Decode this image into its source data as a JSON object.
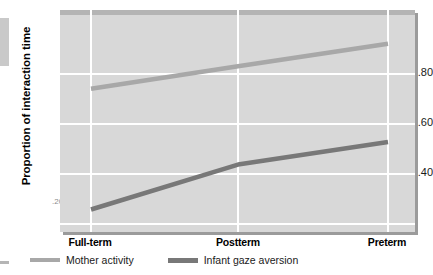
{
  "chart_data": {
    "type": "line",
    "title": "",
    "xlabel": "",
    "ylabel": "Proportion of interaction time",
    "categories": [
      "Full-term",
      "Postterm",
      "Preterm"
    ],
    "ylim": [
      0.21,
      1.0
    ],
    "yticks": [
      "",
      ".40",
      ".60",
      ".80"
    ],
    "ytick_values": [
      0.2,
      0.4,
      0.6,
      0.8
    ],
    "grid": "horizontal-and-vertical",
    "legend_position": "below-plot-left",
    "series": [
      {
        "name": "Mother activity",
        "color": "#a8a8a8",
        "values": [
          0.72,
          0.8,
          0.88
        ]
      },
      {
        "name": "Infant gaze aversion",
        "color": "#787878",
        "values": [
          0.29,
          0.45,
          0.53
        ]
      }
    ]
  },
  "axes": {
    "y_title": "Proportion of interaction time",
    "y_labels": {
      "tick_80": ".80",
      "tick_60": ".60",
      "tick_40": ".40",
      "tick_partial": ".20"
    },
    "x_labels": {
      "cat_1": "Full-term",
      "cat_2": "Postterm",
      "cat_3": "Preterm"
    }
  },
  "legend": {
    "items": [
      {
        "label": "Mother activity",
        "color": "#a8a8a8"
      },
      {
        "label": "Infant gaze aversion",
        "color": "#787878"
      }
    ]
  },
  "colors": {
    "plot_background": "#d8d8d8",
    "gridline": "#ffffff",
    "page_background": "#ffffff",
    "series_light": "#a8a8a8",
    "series_dark": "#787878"
  }
}
